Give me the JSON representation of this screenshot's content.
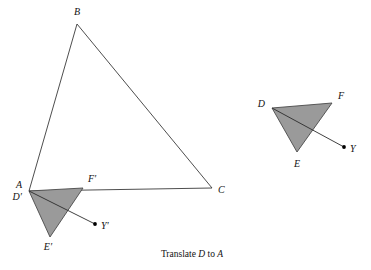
{
  "figure": {
    "title_caption": "Translate D to A",
    "caption_parts": {
      "pre": "Translate ",
      "from_point": "D",
      "mid": " to ",
      "to_point": "A"
    },
    "colors": {
      "background": "#ffffff",
      "stroke": "#3a3a3a",
      "triangle_fill": "#9a9a9a",
      "triangle_stroke": "#4a4a4a",
      "label_color": "#111111",
      "point_dot": "#000000"
    },
    "large_triangle": {
      "name": "triangle-ABC",
      "vertices": [
        {
          "label": "A",
          "x": 29,
          "y": 191,
          "label_x": 22,
          "label_y": 188,
          "anchor": "end"
        },
        {
          "label": "B",
          "x": 77,
          "y": 24,
          "label_x": 77,
          "label_y": 15,
          "anchor": "middle"
        },
        {
          "label": "C",
          "x": 212,
          "y": 188,
          "label_x": 218,
          "label_y": 193,
          "anchor": "start"
        }
      ],
      "filled": false
    },
    "shaded_triangle_original": {
      "name": "triangle-DEF",
      "vertices": [
        {
          "label": "D",
          "x": 272,
          "y": 108,
          "label_x": 265,
          "label_y": 107,
          "anchor": "end"
        },
        {
          "label": "F",
          "x": 332,
          "y": 103,
          "label_x": 338,
          "label_y": 99,
          "anchor": "start"
        },
        {
          "label": "E",
          "x": 297,
          "y": 152,
          "label_x": 297,
          "label_y": 167,
          "anchor": "middle"
        }
      ],
      "ray": {
        "name": "ray-D-to-Y",
        "from_x": 272,
        "from_y": 108,
        "to_x": 344,
        "to_y": 147
      },
      "point": {
        "label": "Y",
        "x": 344,
        "y": 147,
        "label_x": 350,
        "label_y": 152,
        "anchor": "start"
      }
    },
    "shaded_triangle_image": {
      "name": "triangle-D-prime-E-prime-F-prime",
      "vertices": [
        {
          "label": "D′",
          "x": 29,
          "y": 191,
          "label_x": 22,
          "label_y": 200,
          "anchor": "end"
        },
        {
          "label": "F′",
          "x": 83,
          "y": 188,
          "label_x": 88,
          "label_y": 182,
          "anchor": "start"
        },
        {
          "label": "E′",
          "x": 50,
          "y": 237,
          "label_x": 48,
          "label_y": 250,
          "anchor": "middle"
        }
      ],
      "ray": {
        "name": "ray-Dprime-to-Yprime",
        "from_x": 29,
        "from_y": 191,
        "to_x": 95,
        "to_y": 224
      },
      "point": {
        "label": "Y′",
        "x": 95,
        "y": 224,
        "label_x": 101,
        "label_y": 229,
        "anchor": "start"
      }
    },
    "caption_position": {
      "x": 192,
      "y": 257
    }
  }
}
